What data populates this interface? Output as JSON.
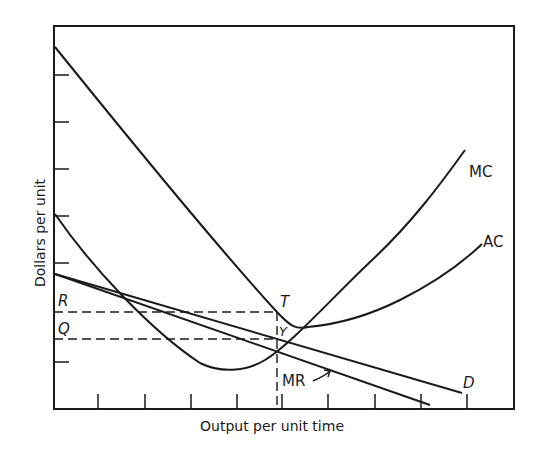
{
  "figure": {
    "type": "economics-cost-revenue-diagram",
    "x_axis_label": "Output per unit time",
    "y_axis_label": "Dollars per unit",
    "colors": {
      "ink": "#1a1a1a",
      "background": "#ffffff"
    }
  },
  "curves": {
    "mc": {
      "label": "MC"
    },
    "ac": {
      "label": "AC"
    },
    "mr": {
      "label": "MR"
    },
    "d": {
      "label": "D"
    }
  },
  "points": {
    "t": {
      "label": "T"
    },
    "y": {
      "label": "Y"
    }
  },
  "y_markers": {
    "r": {
      "label": "R"
    },
    "q": {
      "label": "Q"
    }
  }
}
